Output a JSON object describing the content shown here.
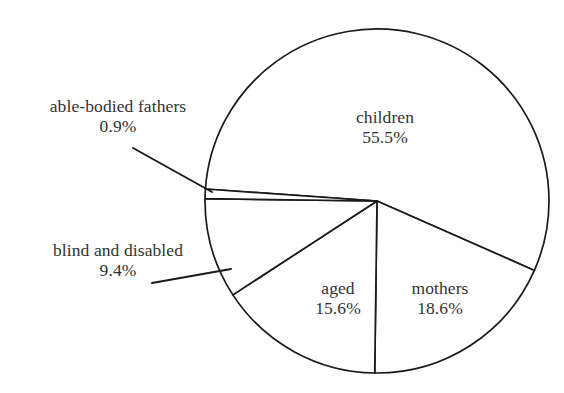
{
  "chart_data": {
    "type": "pie",
    "title": "",
    "subtitle": "",
    "xlabel": "",
    "ylabel": "",
    "legend": "none",
    "grid": false,
    "units": "percent",
    "categories": [
      "children",
      "mothers",
      "aged",
      "blind and disabled",
      "able-bodied fathers"
    ],
    "values": [
      55.5,
      18.6,
      15.6,
      9.4,
      0.9
    ],
    "slices": [
      {
        "label": "children",
        "value": 55.5,
        "value_text": "55.5%",
        "label_placement": "inside",
        "start_angle_deg": 184,
        "end_angle_deg": 383.8,
        "color": "#ffffff",
        "stroke": "#1a1a1a"
      },
      {
        "label": "mothers",
        "value": 18.6,
        "value_text": "18.6%",
        "label_placement": "inside",
        "start_angle_deg": 383.8,
        "end_angle_deg": 450.8,
        "color": "#ffffff",
        "stroke": "#1a1a1a"
      },
      {
        "label": "aged",
        "value": 15.6,
        "value_text": "15.6%",
        "label_placement": "inside",
        "start_angle_deg": 450.8,
        "end_angle_deg": 506.9,
        "color": "#ffffff",
        "stroke": "#1a1a1a"
      },
      {
        "label": "blind and disabled",
        "value": 9.4,
        "value_text": "9.4%",
        "label_placement": "outside-left",
        "start_angle_deg": 506.9,
        "end_angle_deg": 540.7,
        "color": "#ffffff",
        "stroke": "#1a1a1a"
      },
      {
        "label": "able-bodied fathers",
        "value": 0.9,
        "value_text": "0.9%",
        "label_placement": "outside-left",
        "start_angle_deg": 540.7,
        "end_angle_deg": 544.0,
        "color": "#ffffff",
        "stroke": "#1a1a1a"
      }
    ]
  },
  "labels": {
    "children": {
      "name": "children",
      "value": "55.5%"
    },
    "mothers": {
      "name": "mothers",
      "value": "18.6%"
    },
    "aged": {
      "name": "aged",
      "value": "15.6%"
    },
    "blind": {
      "name": "blind and disabled",
      "value": "9.4%"
    },
    "fathers": {
      "name": "able-bodied fathers",
      "value": "0.9%"
    }
  },
  "style": {
    "background": "#ffffff",
    "line_color": "#1a1a1a",
    "text_color": "#333333"
  }
}
